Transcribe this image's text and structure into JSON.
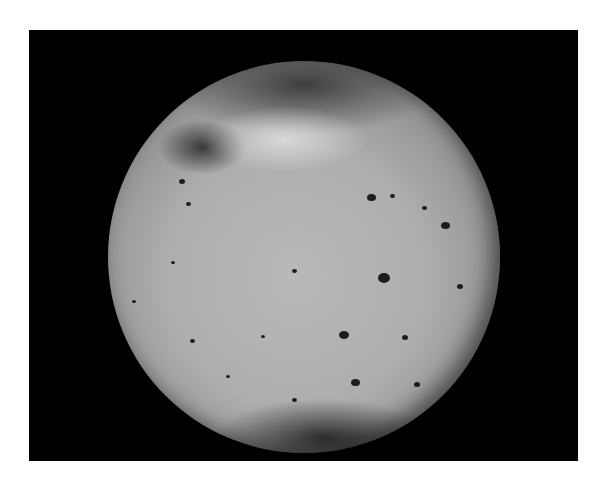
{
  "image": {
    "subject": "planetary-moon-sphere",
    "frame_color": "#000000",
    "page_background": "#ffffff",
    "surface_color": "#b0b0b0",
    "spots": [
      {
        "x": 18,
        "y": 30,
        "s": 6
      },
      {
        "x": 20,
        "y": 36,
        "s": 5
      },
      {
        "x": 66,
        "y": 34,
        "s": 9
      },
      {
        "x": 72,
        "y": 34,
        "s": 5
      },
      {
        "x": 80,
        "y": 37,
        "s": 5
      },
      {
        "x": 85,
        "y": 41,
        "s": 9
      },
      {
        "x": 69,
        "y": 54,
        "s": 12
      },
      {
        "x": 47,
        "y": 53,
        "s": 5
      },
      {
        "x": 16,
        "y": 51,
        "s": 4
      },
      {
        "x": 89,
        "y": 57,
        "s": 6
      },
      {
        "x": 6,
        "y": 61,
        "s": 4
      },
      {
        "x": 59,
        "y": 69,
        "s": 10
      },
      {
        "x": 75,
        "y": 70,
        "s": 6
      },
      {
        "x": 39,
        "y": 70,
        "s": 4
      },
      {
        "x": 62,
        "y": 81,
        "s": 9
      },
      {
        "x": 78,
        "y": 82,
        "s": 6
      },
      {
        "x": 30,
        "y": 80,
        "s": 4
      },
      {
        "x": 47,
        "y": 86,
        "s": 5
      },
      {
        "x": 21,
        "y": 71,
        "s": 5
      }
    ]
  }
}
